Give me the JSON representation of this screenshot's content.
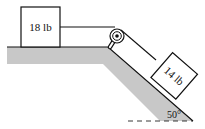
{
  "diagram": {
    "type": "physics-pulley-incline",
    "block_left": {
      "label": "18 lb",
      "surface": "horizontal"
    },
    "block_right": {
      "label": "14 lb",
      "surface": "incline"
    },
    "incline_angle": {
      "label": "50°",
      "value_deg": 50
    },
    "pulley": {
      "location": "top corner of incline"
    },
    "colors": {
      "surface_fill": "#c8c8c8",
      "line": "#111111",
      "block_fill": "#ffffff"
    }
  }
}
